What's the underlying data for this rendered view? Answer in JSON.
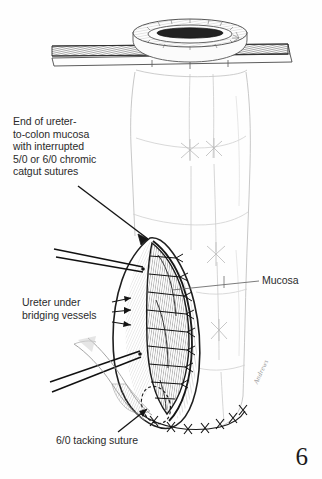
{
  "figure": {
    "page_number": "6",
    "artist_signature": "Andrews",
    "background_color": "#fefefe",
    "ink_color": "#1a1a1a",
    "text_color": "#2b2b2b",
    "faint_line_color": "#c9c9c9"
  },
  "labels": {
    "end_of_ureter": "End of ureter-\nto-colon mucosa\nwith interrupted\n5/0 or 6/0 chromic\ncatgut sutures",
    "ureter_under": "Ureter under\nbridging vessels",
    "tacking_suture": "6/0 tacking suture",
    "mucosa": "Mucosa"
  },
  "anatomy": {
    "organ": "colon",
    "incision_shape": "lens",
    "instruments": [
      "retractor-bar",
      "oval-ring-retractor",
      "forceps-upper",
      "forceps-lower"
    ],
    "suture_counts": {
      "interrupted_mucosal": 9,
      "tacking_row": 7
    }
  }
}
